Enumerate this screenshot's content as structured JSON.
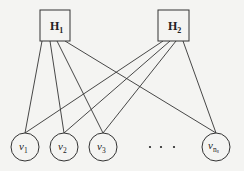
{
  "diagram": {
    "type": "bipartite-graph",
    "hubs": [
      {
        "id": "H1",
        "label": "H",
        "subscript": "1",
        "x": 40,
        "y": 10,
        "w": 30,
        "h": 31
      },
      {
        "id": "H2",
        "label": "H",
        "subscript": "2",
        "x": 158,
        "y": 10,
        "w": 31,
        "h": 31
      }
    ],
    "nodes": [
      {
        "id": "v1",
        "label": "v",
        "subscript": "1",
        "cx": 25,
        "cy": 147,
        "r": 14
      },
      {
        "id": "v2",
        "label": "v",
        "subscript": "2",
        "cx": 64,
        "cy": 147,
        "r": 14
      },
      {
        "id": "v3",
        "label": "v",
        "subscript": "3",
        "cx": 103,
        "cy": 147,
        "r": 14
      },
      {
        "id": "vns",
        "label": "v",
        "subscript": "n",
        "subsubscript": "s",
        "cx": 216,
        "cy": 147,
        "r": 14
      }
    ],
    "ellipsis": {
      "text": "· · ·",
      "dots": [
        150,
        161,
        174
      ],
      "y": 147
    },
    "edges": [
      {
        "from": "H1",
        "to": "v1",
        "x1": 42,
        "y1": 41,
        "x2": 25,
        "y2": 133
      },
      {
        "from": "H1",
        "to": "v2",
        "x1": 50,
        "y1": 41,
        "x2": 64,
        "y2": 133
      },
      {
        "from": "H1",
        "to": "v3",
        "x1": 57,
        "y1": 41,
        "x2": 103,
        "y2": 133
      },
      {
        "from": "H1",
        "to": "vns",
        "x1": 65,
        "y1": 41,
        "x2": 216,
        "y2": 133
      },
      {
        "from": "H2",
        "to": "v1",
        "x1": 163,
        "y1": 41,
        "x2": 25,
        "y2": 133
      },
      {
        "from": "H2",
        "to": "v2",
        "x1": 170,
        "y1": 41,
        "x2": 64,
        "y2": 133
      },
      {
        "from": "H2",
        "to": "v3",
        "x1": 176,
        "y1": 41,
        "x2": 103,
        "y2": 133
      },
      {
        "from": "H2",
        "to": "vns",
        "x1": 183,
        "y1": 41,
        "x2": 216,
        "y2": 133
      }
    ]
  }
}
